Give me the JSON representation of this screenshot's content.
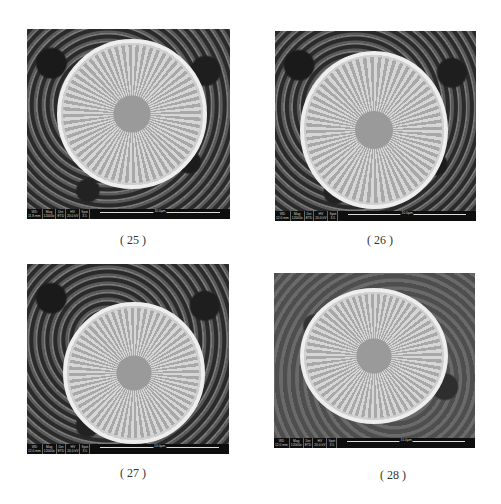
{
  "figures": [
    {
      "caption": "( 25 )",
      "info": {
        "wd_label": "WD",
        "wd": "11.8 mm",
        "mag_label": "Mag",
        "mag": "12000x",
        "det_label": "Det",
        "det": "ETD",
        "hv_label": "HV",
        "hv": "20.0 kV",
        "spot_label": "Spot",
        "spot": "3.5",
        "scale": "10.0μm"
      }
    },
    {
      "caption": "( 26 )",
      "info": {
        "wd_label": "WD",
        "wd": "12.0 mm",
        "mag_label": "Mag",
        "mag": "12000x",
        "det_label": "Det",
        "det": "ETD",
        "hv_label": "HV",
        "hv": "20.0 kV",
        "spot_label": "Spot",
        "spot": "3.5",
        "scale": "10.0μm"
      }
    },
    {
      "caption": "( 27 )",
      "info": {
        "wd_label": "WD",
        "wd": "12.0 mm",
        "mag_label": "Mag",
        "mag": "12000x",
        "det_label": "Det",
        "det": "ETD",
        "hv_label": "HV",
        "hv": "20.0 kV",
        "spot_label": "Spot",
        "spot": "3.5",
        "scale": "10.0μm"
      }
    },
    {
      "caption": "( 28 )",
      "info": {
        "wd_label": "WD",
        "wd": "12.0 mm",
        "mag_label": "Mag",
        "mag": "12000x",
        "det_label": "Det",
        "det": "ETD",
        "hv_label": "HV",
        "hv": "20.0 kV",
        "spot_label": "Spot",
        "spot": "3.5",
        "scale": "10.0μm"
      }
    }
  ]
}
